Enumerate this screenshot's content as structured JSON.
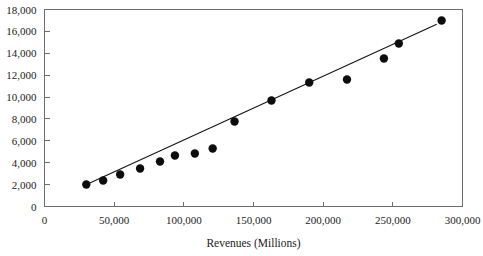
{
  "chart_data": {
    "type": "scatter",
    "title": "",
    "subtitle": "",
    "xlabel": "Revenues (Millions)",
    "ylabel": "",
    "xlim": [
      0,
      300000
    ],
    "ylim": [
      0,
      18000
    ],
    "grid": false,
    "legend": null,
    "legend_position": "none",
    "x_ticks": [
      0,
      50000,
      100000,
      150000,
      200000,
      250000,
      300000
    ],
    "x_tick_labels": [
      "0",
      "50,000",
      "100,000",
      "150,000",
      "200,000",
      "250,000",
      "300,000"
    ],
    "y_ticks": [
      0,
      2000,
      4000,
      6000,
      8000,
      10000,
      12000,
      14000,
      16000,
      18000
    ],
    "y_tick_labels": [
      "0",
      "2,000",
      "4,000",
      "6,000",
      "8,000",
      "10,000",
      "12,000",
      "14,000",
      "16,000",
      "18,000"
    ],
    "marker_style": "filled-circle",
    "marker_color": "#0d0d0d",
    "marker_radius": 4.2,
    "series": [
      {
        "name": "Observations",
        "type": "scatter",
        "points": [
          {
            "x": 30000,
            "y": 2010
          },
          {
            "x": 42100,
            "y": 2376
          },
          {
            "x": 54300,
            "y": 2925
          },
          {
            "x": 68600,
            "y": 3473
          },
          {
            "x": 82900,
            "y": 4112
          },
          {
            "x": 93600,
            "y": 4660
          },
          {
            "x": 107900,
            "y": 4843
          },
          {
            "x": 120700,
            "y": 5300
          },
          {
            "x": 136400,
            "y": 7767
          },
          {
            "x": 162900,
            "y": 9686
          },
          {
            "x": 190000,
            "y": 11330
          },
          {
            "x": 217100,
            "y": 11605
          },
          {
            "x": 243600,
            "y": 13524
          },
          {
            "x": 254300,
            "y": 14895
          },
          {
            "x": 285000,
            "y": 17000
          }
        ]
      },
      {
        "name": "Trend line",
        "type": "line",
        "color": "#131313",
        "points": [
          {
            "x": 28600,
            "y": 1920
          },
          {
            "x": 281500,
            "y": 16650
          }
        ]
      }
    ]
  },
  "axis": {
    "x_title": "Revenues (Millions)"
  },
  "colors": {
    "axis": "#6e6e6e",
    "text": "#1b1b1b",
    "marker": "#0d0d0d",
    "trend": "#131313",
    "background": "#ffffff"
  }
}
